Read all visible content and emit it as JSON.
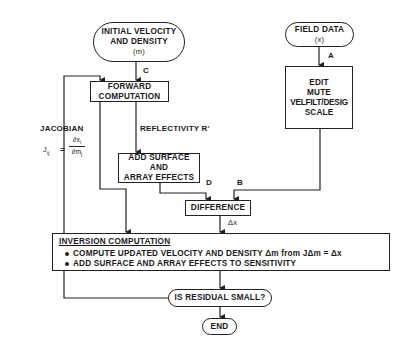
{
  "nodes": {
    "initial": {
      "line1": "INITIAL VELOCITY",
      "line2": "AND DENSITY",
      "line3": "(m)"
    },
    "field_data": {
      "line1": "FIELD DATA",
      "line2": "(x)"
    },
    "edit": {
      "line1": "EDIT",
      "line2": "MUTE",
      "line3": "VELFILT/DESIG",
      "line4": "SCALE"
    },
    "forward": {
      "line1": "FORWARD",
      "line2": "COMPUTATION"
    },
    "add_surface": {
      "line1": "ADD SURFACE",
      "line2": "AND",
      "line3": "ARRAY EFFECTS"
    },
    "difference": {
      "label": "DIFFERENCE"
    },
    "inversion": {
      "title": "INVERSION COMPUTATION",
      "bullets": [
        "COMPUTE UPDATED VELOCITY AND DENSITY Δm from JΔm = Δx",
        "ADD SURFACE AND ARRAY EFFECTS TO SENSITIVITY"
      ]
    },
    "residual": {
      "label": "IS RESIDUAL SMALL?"
    },
    "end": {
      "label": "END"
    }
  },
  "edge_labels": {
    "a": "A",
    "b": "B",
    "c": "C",
    "d": "D",
    "reflectivity": "REFLECTIVITY R'",
    "delta_x": "Δx"
  },
  "jacobian": {
    "title": "JACOBIAN",
    "lhs": "J",
    "sub": "ij",
    "eq": "=",
    "numerator": "∂x",
    "numerator_sub": "i",
    "denominator": "∂m",
    "denominator_sub": "j"
  },
  "colors": {
    "line": "#222222",
    "background": "#ffffff"
  }
}
